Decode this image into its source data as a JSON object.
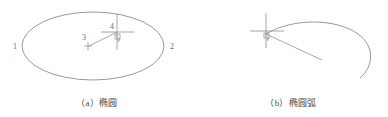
{
  "figure": {
    "background_color": "#ffffff",
    "stroke_color": "#8a8a8a",
    "label_color": "#6b6b6b",
    "caption_color": "#4a4a4a",
    "panels": [
      {
        "id": "a",
        "caption": "（a）椭圆",
        "object_type": "ellipse",
        "grip_labels": [
          "1",
          "2",
          "3",
          "4"
        ],
        "cursor": "crosshair-pickbox-cursor"
      },
      {
        "id": "b",
        "caption": "（b）椭圆弧",
        "object_type": "elliptical-arc",
        "grip_labels": [],
        "cursor": "crosshair-pickbox-cursor"
      }
    ]
  },
  "panel_a": {
    "caption": "（a）椭圆",
    "label_left": "1",
    "label_right": "2",
    "label_center": "3",
    "label_quadrant": "4"
  },
  "panel_b": {
    "caption": "（b）椭圆弧"
  }
}
